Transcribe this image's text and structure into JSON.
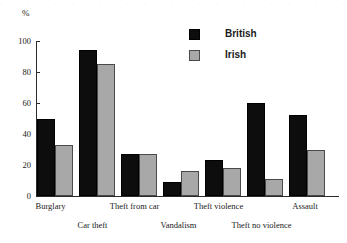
{
  "scan_artifact_text": ". . . . . . . . . . . . . . . . . . . . . . . . . . . . . . . . . . . . . . . . . . . . . .",
  "axis": {
    "y_title": "%",
    "y_ticks": [
      "100",
      "80",
      "60",
      "40",
      "20",
      "0"
    ]
  },
  "legend": {
    "entries": [
      {
        "label": "British",
        "color": "#0d0d0d",
        "swatch_name": "legend-swatch-british"
      },
      {
        "label": "Irish",
        "color": "#a8a8a8",
        "swatch_name": "legend-swatch-irish"
      }
    ]
  },
  "chart_data": {
    "type": "bar",
    "title": "",
    "xlabel": "",
    "ylabel": "%",
    "ylim": [
      0,
      100
    ],
    "ytick_step": 20,
    "grid": false,
    "legend_position": "top-center-right",
    "categories": [
      "Burglary",
      "Car theft",
      "Theft from car",
      "Vandalism",
      "Theft violence",
      "Theft no violence",
      "Assault"
    ],
    "series": [
      {
        "name": "British",
        "color": "#0d0d0d",
        "values": [
          50,
          94,
          27,
          9,
          23,
          60,
          52
        ]
      },
      {
        "name": "Irish",
        "color": "#a8a8a8",
        "values": [
          33,
          85,
          27,
          16,
          18,
          11,
          30
        ]
      }
    ]
  }
}
